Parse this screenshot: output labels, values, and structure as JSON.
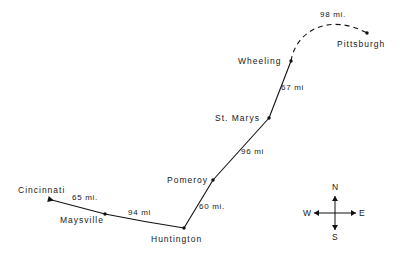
{
  "map": {
    "title": "Ohio River route map",
    "background_color": "#ffffff",
    "line_color": "#111111",
    "text_color": "#1a1a1a",
    "cities": [
      {
        "name": "Cincinnati",
        "label_x": 18,
        "label_y": 186,
        "dot_x": 48,
        "dot_y": 199,
        "has_dot": false,
        "terminus_arrow": true
      },
      {
        "name": "Maysville",
        "label_x": 60,
        "label_y": 216,
        "dot_x": 105,
        "dot_y": 214,
        "has_dot": true,
        "terminus_arrow": false
      },
      {
        "name": "Huntington",
        "label_x": 151,
        "label_y": 235,
        "dot_x": 184,
        "dot_y": 228,
        "has_dot": true,
        "terminus_arrow": false
      },
      {
        "name": "Pomeroy",
        "label_x": 167,
        "label_y": 176,
        "dot_x": 213,
        "dot_y": 180,
        "has_dot": true,
        "terminus_arrow": false
      },
      {
        "name": "St. Marys",
        "label_x": 215,
        "label_y": 114,
        "dot_x": 269,
        "dot_y": 118,
        "has_dot": true,
        "terminus_arrow": false
      },
      {
        "name": "Wheeling",
        "label_x": 238,
        "label_y": 57,
        "dot_x": 291,
        "dot_y": 61,
        "has_dot": true,
        "terminus_arrow": false
      },
      {
        "name": "Pittsburgh",
        "label_x": 337,
        "label_y": 40,
        "dot_x": 367,
        "dot_y": 33,
        "has_dot": true,
        "terminus_arrow": false
      }
    ],
    "segments": [
      {
        "from": "Cincinnati",
        "to": "Maysville",
        "distance": "65 mi.",
        "label_x": 72,
        "label_y": 194,
        "style": "solid"
      },
      {
        "from": "Maysville",
        "to": "Huntington",
        "distance": "94 mi",
        "label_x": 128,
        "label_y": 209,
        "style": "solid"
      },
      {
        "from": "Huntington",
        "to": "Pomeroy",
        "distance": "60 mi.",
        "label_x": 199,
        "label_y": 203,
        "style": "solid"
      },
      {
        "from": "Pomeroy",
        "to": "St. Marys",
        "distance": "96 mi",
        "label_x": 241,
        "label_y": 148,
        "style": "solid"
      },
      {
        "from": "St. Marys",
        "to": "Wheeling",
        "distance": "67 mi",
        "label_x": 281,
        "label_y": 84,
        "style": "solid"
      },
      {
        "from": "Wheeling",
        "to": "Pittsburgh",
        "distance": "98 mi.",
        "label_x": 320,
        "label_y": 11,
        "style": "dashed"
      }
    ],
    "compass": {
      "center_x": 335,
      "center_y": 213,
      "north": "N",
      "south": "S",
      "east": "E",
      "west": "W"
    }
  }
}
